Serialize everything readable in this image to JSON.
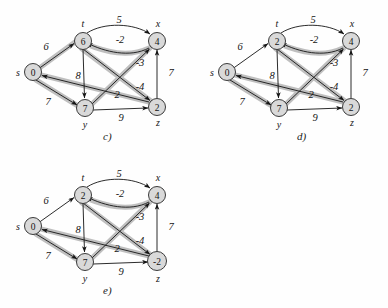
{
  "figure": {
    "background": "#fefefe",
    "node_fill": "#d9d9d9",
    "node_stroke": "#3a3a3a",
    "edge_color": "#1a1a1a",
    "highlight_color": "#bfbfbf"
  },
  "node_labels": {
    "s": "s",
    "t": "t",
    "x": "x",
    "y": "y",
    "z": "z"
  },
  "edge_weights": {
    "s_t": "6",
    "s_y": "7",
    "t_x": "5",
    "t_y": "8",
    "t_z": "-4",
    "x_t": "-2",
    "y_x": "-3",
    "y_z": "9",
    "z_x": "7",
    "z_s": "2"
  },
  "panels": [
    {
      "id": "c",
      "caption": "c)",
      "values": {
        "s": "0",
        "t": "6",
        "x": "4",
        "y": "7",
        "z": "2"
      },
      "highlighted_edges": [
        "s_t",
        "s_y",
        "t_z",
        "x_t",
        "y_x",
        "z_s"
      ]
    },
    {
      "id": "d",
      "caption": "d)",
      "values": {
        "s": "0",
        "t": "2",
        "x": "4",
        "y": "7",
        "z": "2"
      },
      "highlighted_edges": [
        "s_y",
        "t_z",
        "x_t",
        "y_x",
        "z_s"
      ]
    },
    {
      "id": "e",
      "caption": "e)",
      "values": {
        "s": "0",
        "t": "2",
        "x": "4",
        "y": "7",
        "z": "-2"
      },
      "highlighted_edges": [
        "s_y",
        "t_z",
        "x_t",
        "y_x",
        "z_s"
      ]
    }
  ]
}
